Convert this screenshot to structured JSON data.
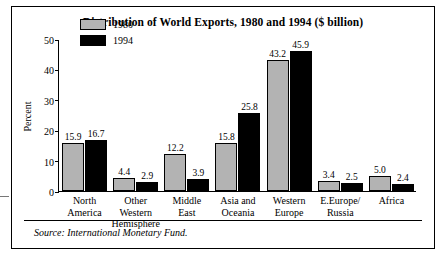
{
  "chart_data": {
    "type": "bar",
    "title": "Distribution of World Exports, 1980 and 1994 ($ billion)",
    "xlabel": "",
    "ylabel": "Percent",
    "ylim": [
      0,
      50
    ],
    "yticks": [
      0,
      10,
      20,
      30,
      40,
      50
    ],
    "grid": false,
    "legend_position": "top-left-inside",
    "categories": [
      "North\nAmerica",
      "Other\nWestern\nHemisphere",
      "Middle\nEast",
      "Asia and\nOceania",
      "Western\nEurope",
      "E.Europe/\nRussia",
      "Africa"
    ],
    "category_lines": [
      [
        "North",
        "America"
      ],
      [
        "Other",
        "Western",
        "Hemisphere"
      ],
      [
        "Middle",
        "East"
      ],
      [
        "Asia and",
        "Oceania"
      ],
      [
        "Western",
        "Europe"
      ],
      [
        "E.Europe/",
        "Russia"
      ],
      [
        "Africa"
      ]
    ],
    "series": [
      {
        "name": "1980",
        "color": "#b3b3b3",
        "values": [
          15.9,
          4.4,
          12.2,
          15.8,
          43.2,
          3.4,
          5.0
        ],
        "labels": [
          "15.9",
          "4.4",
          "12.2",
          "15.8",
          "43.2",
          "3.4",
          "5.0"
        ]
      },
      {
        "name": "1994",
        "color": "#000000",
        "values": [
          16.7,
          2.9,
          3.9,
          25.8,
          45.9,
          2.5,
          2.4
        ],
        "labels": [
          "16.7",
          "2.9",
          "3.9",
          "25.8",
          "45.9",
          "2.5",
          "2.4"
        ]
      }
    ],
    "source": "Source: International Monetary Fund."
  }
}
